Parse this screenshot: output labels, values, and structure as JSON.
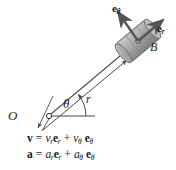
{
  "figure": {
    "background_color": "#ffffff",
    "line_color": "#3a3a3a",
    "text_color": "#1a1a1a",
    "block_fill_color": "#a8a8a8",
    "block_edge_color": "#6e6e6e",
    "arrow_color": "#4a4a4a"
  },
  "labels": {
    "origin": "O",
    "angle": "θ",
    "radius": "r",
    "body": "B",
    "unit_vector_radial": "e",
    "unit_vector_radial_sub": "r",
    "unit_vector_transverse": "e",
    "unit_vector_transverse_sub": "θ"
  },
  "equations": {
    "velocity": {
      "lhs": "v",
      "eq": "=",
      "term1_coef": "v",
      "term1_coef_sub": "r",
      "term1_vec": "e",
      "term1_vec_sub": "r",
      "plus": "+",
      "term2_coef": "v",
      "term2_coef_sub": "θ",
      "term2_vec": "e",
      "term2_vec_sub": "θ",
      "full_text": "v = v_r e_r + v_θ e_θ"
    },
    "acceleration": {
      "lhs": "a",
      "eq": "=",
      "term1_coef": "a",
      "term1_coef_sub": "r",
      "term1_vec": "e",
      "term1_vec_sub": "r",
      "plus": "+",
      "term2_coef": "a",
      "term2_coef_sub": "θ",
      "term2_vec": "e",
      "term2_vec_sub": "θ",
      "full_text": "a = a_r e_r + a_θ e_θ"
    }
  },
  "geometry": {
    "origin_point": [
      48,
      116
    ],
    "body_point": [
      138,
      41
    ],
    "radial_angle_deg": 39.8,
    "dimension_arrow_from": [
      40,
      133
    ],
    "dimension_arrow_to": [
      130,
      58
    ],
    "reference_axis_to": [
      92,
      116
    ]
  }
}
